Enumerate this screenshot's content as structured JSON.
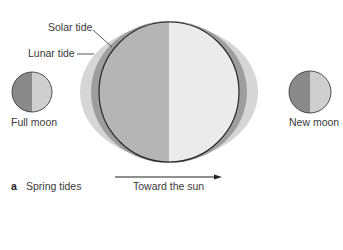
{
  "figure": {
    "panel_letter": "a",
    "panel_title": "Spring tides",
    "direction_label": "Toward the sun"
  },
  "labels": {
    "solar_tide": "Solar tide",
    "lunar_tide": "Lunar tide",
    "full_moon": "Full moon",
    "new_moon": "New moon"
  },
  "colors": {
    "solar_tide_fill": "#d6d6d6",
    "lunar_tide_fill": "#9e9e9e",
    "earth_night": "#b5b5b5",
    "earth_day": "#ebebeb",
    "moon_dark": "#8a8a8a",
    "moon_light": "#cfcfcf",
    "outline": "#2a2a2a"
  }
}
